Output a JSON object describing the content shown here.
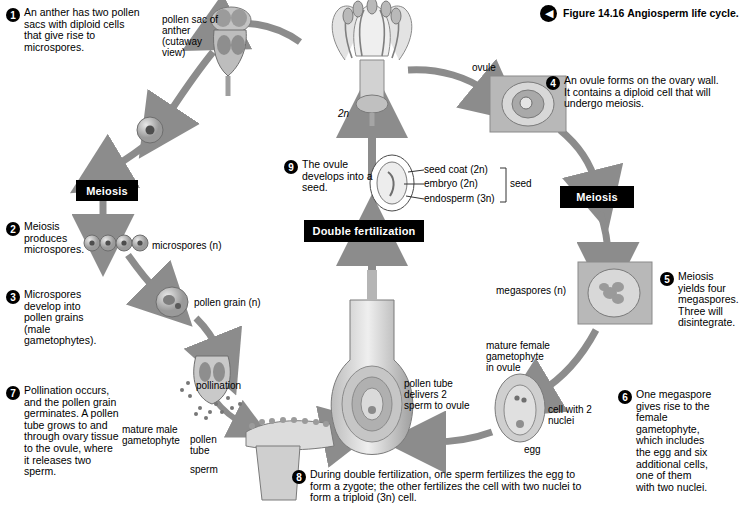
{
  "figure": {
    "chevron_icon": "chevron-left-icon",
    "number": "Figure 14.16",
    "title": "Angiosperm life cycle."
  },
  "steps": [
    {
      "n": "1",
      "text": "An anther has two pollen sacs with diploid cells that give rise to microspores."
    },
    {
      "n": "2",
      "text": "Meiosis produces microspores."
    },
    {
      "n": "3",
      "text": "Microspores develop into pollen grains (male gametophytes)."
    },
    {
      "n": "4",
      "text": "An ovule forms on the ovary wall. It contains a diploid cell that will undergo meiosis."
    },
    {
      "n": "5",
      "text": "Meiosis yields four megaspores. Three will disintegrate."
    },
    {
      "n": "6",
      "text": "One megaspore gives rise to the female gametophyte, which includes the egg and six additional cells, one of them with two nuclei."
    },
    {
      "n": "7",
      "text": "Pollination occurs, and the pollen grain germinates. A pollen tube grows to and through ovary tissue to the ovule, where it releases two sperm."
    },
    {
      "n": "8",
      "text": "During double fertilization, one sperm fertilizes the egg to form a zygote; the other fertilizes the cell with two nuclei to form a triploid (3n) cell."
    },
    {
      "n": "9",
      "text": "The ovule develops into a seed."
    }
  ],
  "boxes": {
    "meiosis_left": "Meiosis",
    "meiosis_right": "Meiosis",
    "double_fertilization": "Double fertilization"
  },
  "labels": {
    "pollen_sac": "pollen sac of anther (cutaway view)",
    "ovule": "ovule",
    "ploidy_2n": "2n",
    "microspores": "microspores (n)",
    "pollen_grain": "pollen grain (n)",
    "pollination": "pollination",
    "megaspores": "megaspores (n)",
    "seed_coat": "seed coat (2n)",
    "embryo": "embryo (2n)",
    "endosperm": "endosperm (3n)",
    "seed": "seed",
    "mature_female_gametophyte": "mature female gametophyte in ovule",
    "cell_two_nuclei": "cell with 2 nuclei",
    "egg": "egg",
    "pollen_tube_delivers": "pollen tube delivers 2 sperm to ovule",
    "mature_male_gametophyte": "mature male gametophyte",
    "pollen_tube": "pollen tube",
    "sperm": "sperm"
  }
}
